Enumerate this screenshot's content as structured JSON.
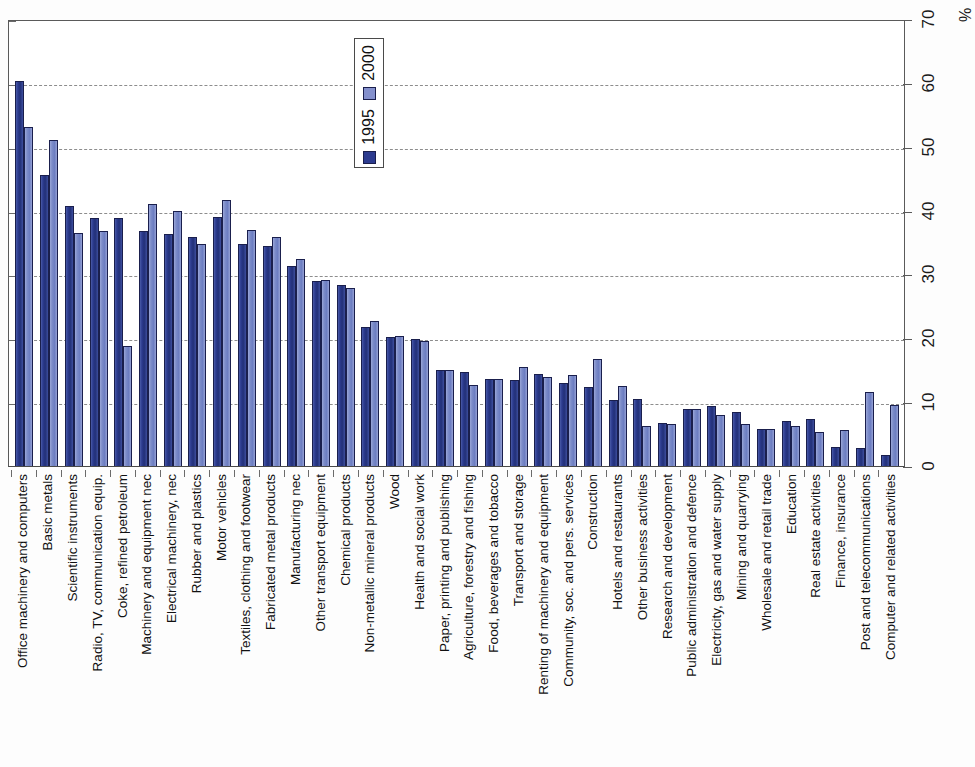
{
  "axis": {
    "unit": "%",
    "ticks": [
      "0",
      "10",
      "20",
      "30",
      "40",
      "50",
      "60",
      "70"
    ]
  },
  "legend": {
    "entries": [
      {
        "label": "2000",
        "color": "#8490cd"
      },
      {
        "label": "1995",
        "color": "#2c3b8f"
      }
    ]
  },
  "chart_data": {
    "type": "bar",
    "title": "",
    "subtitle": "",
    "xlabel": "",
    "ylabel": "%",
    "ylim": [
      0,
      70
    ],
    "grid": true,
    "legend_position": "inside-top-center",
    "categories": [
      "Office machinery and computers",
      "Basic metals",
      "Scientific instruments",
      "Radio, TV, communication equip.",
      "Coke, refined petroleum",
      "Machinery and equipment nec",
      "Electrical machinery, nec",
      "Rubber and plastics",
      "Motor vehicles",
      "Textiles, clothing and footwear",
      "Fabricated metal products",
      "Manufacturing nec",
      "Other transport equipment",
      "Chemical products",
      "Non-metallic mineral products",
      "Wood",
      "Health and social work",
      "Paper, printing and publishing",
      "Agriculture, forestry and fishing",
      "Food, beverages and tobacco",
      "Transport and storage",
      "Renting of machinery and equipment",
      "Community, soc. and pers. services",
      "Construction",
      "Hotels and restaurants",
      "Other business activities",
      "Research and development",
      "Public administration and defence",
      "Electricity, gas and water supply",
      "Mining and quarrying",
      "Wholesale and retail trade",
      "Education",
      "Real estate activities",
      "Finance, insurance",
      "Post and telecommunications",
      "Computer and related activities"
    ],
    "series": [
      {
        "name": "1995",
        "color": "#2c3b8f",
        "values": [
          60.3,
          45.6,
          40.7,
          38.8,
          38.8,
          36.8,
          36.4,
          35.8,
          39.0,
          34.8,
          34.5,
          31.4,
          29.0,
          28.3,
          21.7,
          20.2,
          19.9,
          15.0,
          14.7,
          13.6,
          13.4,
          14.4,
          13.0,
          12.3,
          10.4,
          10.5,
          6.8,
          9.0,
          9.4,
          8.4,
          5.8,
          7.0,
          7.3,
          3.0,
          2.8,
          1.8
        ]
      },
      {
        "name": "2000",
        "color": "#8490cd",
        "values": [
          53.1,
          51.0,
          36.5,
          36.8,
          18.8,
          41.0,
          39.9,
          34.7,
          41.7,
          37.0,
          35.8,
          32.4,
          29.1,
          27.8,
          22.7,
          20.4,
          19.6,
          15.0,
          12.7,
          13.6,
          15.5,
          14.0,
          14.3,
          16.8,
          12.6,
          6.2,
          6.6,
          8.9,
          8.0,
          6.6,
          5.8,
          6.2,
          5.4,
          5.7,
          11.6,
          9.6
        ]
      }
    ]
  }
}
